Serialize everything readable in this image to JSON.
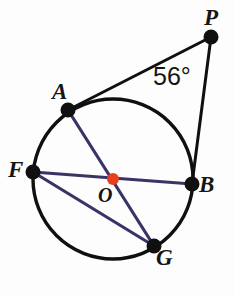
{
  "figure": {
    "kind": "circle-geometry-diagram",
    "background_color": "#fdfdfd",
    "width": 234,
    "height": 295
  },
  "circle": {
    "name": "circle-O",
    "center_x": 113,
    "center_y": 179,
    "radius": 80,
    "stroke_color": "#101010",
    "stroke_width": 3.4,
    "fill": "none"
  },
  "center_marker": {
    "name": "center-point-O",
    "x": 113,
    "y": 179,
    "radius": 6,
    "color": "#e8401c"
  },
  "points": [
    {
      "id": "P",
      "label": "P",
      "x": 211,
      "y": 37,
      "on_circle": false,
      "dot_radius": 7.5,
      "color": "#101010"
    },
    {
      "id": "A",
      "label": "A",
      "x": 68,
      "y": 110,
      "on_circle": true,
      "dot_radius": 7.5,
      "color": "#101010"
    },
    {
      "id": "F",
      "label": "F",
      "x": 33,
      "y": 172,
      "on_circle": true,
      "dot_radius": 7.5,
      "color": "#101010"
    },
    {
      "id": "B",
      "label": "B",
      "x": 192,
      "y": 184,
      "on_circle": true,
      "dot_radius": 7.5,
      "color": "#101010"
    },
    {
      "id": "O",
      "label": "O",
      "x": 113,
      "y": 179,
      "on_circle": false,
      "dot_radius": 6,
      "color": "#e8401c"
    },
    {
      "id": "G",
      "label": "G",
      "x": 154,
      "y": 246,
      "on_circle": true,
      "dot_radius": 7.5,
      "color": "#101010"
    }
  ],
  "segments": [
    {
      "name": "segment-PA",
      "from": "P",
      "to": "A",
      "x1": 211,
      "y1": 37,
      "x2": 68,
      "y2": 110,
      "color": "#101010",
      "width": 3.0,
      "role": "tangent-line"
    },
    {
      "name": "segment-PB",
      "from": "P",
      "to": "B",
      "x1": 211,
      "y1": 37,
      "x2": 192,
      "y2": 184,
      "color": "#101010",
      "width": 3.0,
      "role": "secant-line"
    },
    {
      "name": "chord-FB",
      "from": "F",
      "to": "B",
      "x1": 33,
      "y1": 172,
      "x2": 192,
      "y2": 184,
      "color": "#3a3466",
      "width": 3.2,
      "role": "diameter"
    },
    {
      "name": "chord-AG",
      "from": "A",
      "to": "G",
      "x1": 68,
      "y1": 110,
      "x2": 154,
      "y2": 246,
      "color": "#3a3466",
      "width": 3.2,
      "role": "diameter"
    },
    {
      "name": "chord-FG",
      "from": "F",
      "to": "G",
      "x1": 33,
      "y1": 172,
      "x2": 154,
      "y2": 246,
      "color": "#3a3466",
      "width": 3.2,
      "role": "chord"
    }
  ],
  "angles": [
    {
      "name": "angle-at-P",
      "vertex": "P",
      "value": "56°",
      "x": 153,
      "y": 64
    }
  ],
  "labels": {
    "P": "P",
    "A": "A",
    "F": "F",
    "B": "B",
    "O": "O",
    "G": "G",
    "angle_P": "56°"
  },
  "colors": {
    "outline": "#101010",
    "chord": "#3a3466",
    "center_dot": "#e8401c",
    "text": "#151515",
    "background": "#fdfdfd"
  }
}
